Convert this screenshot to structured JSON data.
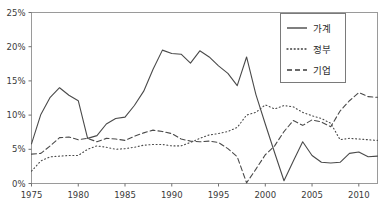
{
  "chart_data": {
    "type": "line",
    "title": "",
    "subtitle": "",
    "xlabel": "",
    "ylabel": "",
    "xlim": [
      1975,
      2012
    ],
    "ylim": [
      0,
      25
    ],
    "grid": false,
    "legend_position": "top-right",
    "x_tick_labels": [
      "1975",
      "1980",
      "1985",
      "1990",
      "1995",
      "2000",
      "2005",
      "2010"
    ],
    "x_tick_values": [
      1975,
      1980,
      1985,
      1990,
      1995,
      2000,
      2005,
      2010
    ],
    "y_tick_labels": [
      "0%",
      "5%",
      "10%",
      "15%",
      "20%",
      "25%"
    ],
    "y_tick_values": [
      0,
      5,
      10,
      15,
      20,
      25
    ],
    "x": [
      1975,
      1976,
      1977,
      1978,
      1979,
      1980,
      1981,
      1982,
      1983,
      1984,
      1985,
      1986,
      1987,
      1988,
      1989,
      1990,
      1991,
      1992,
      1993,
      1994,
      1995,
      1996,
      1997,
      1998,
      1999,
      2000,
      2001,
      2002,
      2003,
      2004,
      2005,
      2006,
      2007,
      2008,
      2009,
      2010,
      2011,
      2012
    ],
    "series": [
      {
        "name": "가계",
        "style": "solid",
        "values": [
          5.8,
          10.1,
          12.6,
          14.0,
          12.9,
          12.1,
          6.6,
          7.0,
          8.7,
          9.5,
          9.7,
          11.4,
          13.5,
          16.7,
          19.5,
          19.0,
          18.9,
          17.6,
          19.4,
          18.5,
          17.2,
          16.1,
          14.3,
          18.5,
          13.0,
          8.7,
          4.5,
          0.4,
          3.3,
          6.1,
          4.1,
          3.1,
          3.0,
          3.1,
          4.4,
          4.6,
          3.9,
          4.0
        ]
      },
      {
        "name": "정부",
        "style": "dotted",
        "values": [
          1.8,
          3.3,
          3.9,
          4.0,
          4.1,
          4.1,
          5.0,
          5.5,
          5.3,
          5.0,
          5.1,
          5.3,
          5.6,
          5.7,
          5.7,
          5.5,
          5.5,
          6.0,
          6.6,
          7.1,
          7.3,
          7.6,
          8.2,
          10.0,
          10.4,
          11.5,
          10.9,
          11.4,
          11.2,
          10.4,
          9.9,
          9.5,
          8.8,
          6.4,
          6.6,
          6.5,
          6.4,
          6.3
        ]
      },
      {
        "name": "기업",
        "style": "dashed",
        "values": [
          4.3,
          4.4,
          5.5,
          6.7,
          6.8,
          6.4,
          6.6,
          6.1,
          6.6,
          6.5,
          6.3,
          6.9,
          7.4,
          7.8,
          7.6,
          7.3,
          6.5,
          6.2,
          6.1,
          6.2,
          6.0,
          5.1,
          3.9,
          0.1,
          2.1,
          4.2,
          5.5,
          7.6,
          9.2,
          8.5,
          9.3,
          9.0,
          8.3,
          10.6,
          12.1,
          13.3,
          12.7,
          12.6
        ]
      }
    ]
  },
  "legend": {
    "entries": [
      {
        "label": "가계",
        "style": "solid"
      },
      {
        "label": "정부",
        "style": "dotted"
      },
      {
        "label": "기업",
        "style": "dashed"
      }
    ]
  }
}
